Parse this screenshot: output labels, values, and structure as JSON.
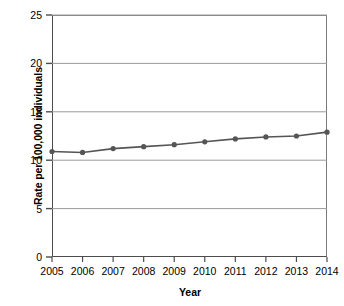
{
  "chart_data": {
    "type": "line",
    "title": "",
    "xlabel": "Year",
    "ylabel": "Rate per 100,000 individuals",
    "categories": [
      "2005",
      "2006",
      "2007",
      "2008",
      "2009",
      "2010",
      "2011",
      "2012",
      "2013",
      "2014"
    ],
    "x": [
      2005,
      2006,
      2007,
      2008,
      2009,
      2010,
      2011,
      2012,
      2013,
      2014
    ],
    "values": [
      10.9,
      10.8,
      11.2,
      11.4,
      11.6,
      11.9,
      12.2,
      12.4,
      12.5,
      12.9
    ],
    "series": [
      {
        "name": "Rate per 100,000 individuals",
        "values": [
          10.9,
          10.8,
          11.2,
          11.4,
          11.6,
          11.9,
          12.2,
          12.4,
          12.5,
          12.9
        ]
      }
    ],
    "ylim": [
      0,
      25
    ],
    "yticks": [
      0,
      5,
      10,
      15,
      20,
      25
    ],
    "ytick_labels": [
      "0",
      "5",
      "10",
      "15",
      "20",
      "25"
    ],
    "xlim": [
      2005,
      2014
    ],
    "grid": "horizontal",
    "legend": "none",
    "marker": "circle",
    "line_color": "#555555",
    "marker_color": "#555555",
    "axis_color": "#4d4d4d",
    "gridline_color": "#9a9a9a",
    "background_color": "#ffffff"
  },
  "axis": {
    "y_title": "Rate per 100,000 individuals",
    "x_title": "Year",
    "y_labels": [
      "25",
      "20",
      "15",
      "10",
      "5",
      "0"
    ],
    "x_labels": [
      "2005",
      "2006",
      "2007",
      "2008",
      "2009",
      "2010",
      "2011",
      "2012",
      "2013",
      "2014"
    ]
  }
}
